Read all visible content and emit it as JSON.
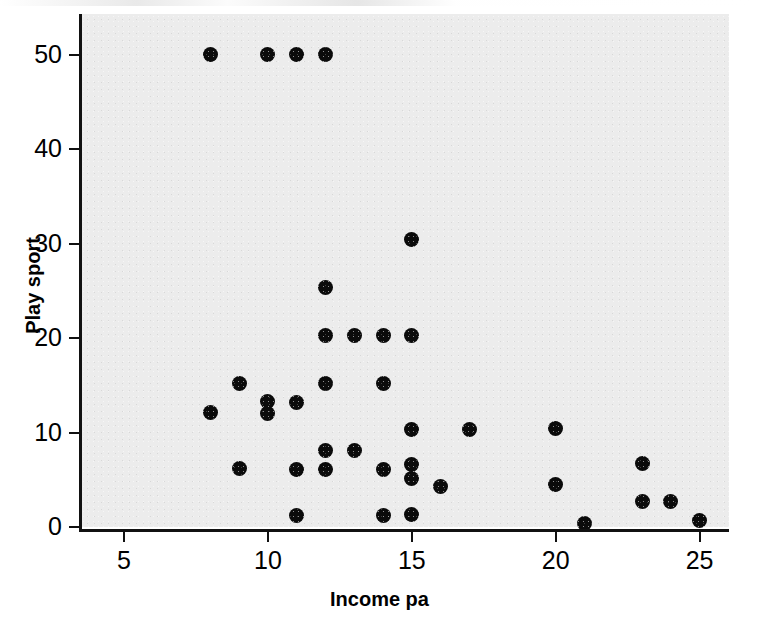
{
  "chart_data": {
    "type": "scatter",
    "title": "",
    "xlabel": "Income pa",
    "ylabel": "Play sport",
    "xlim": [
      3.8,
      26.3
    ],
    "ylim": [
      -1.5,
      54.5
    ],
    "xticks": [
      5,
      10,
      15,
      20,
      25
    ],
    "yticks": [
      0,
      10,
      20,
      30,
      40,
      50
    ],
    "xtick_labels": [
      "5",
      "10",
      "15",
      "20",
      "25"
    ],
    "ytick_labels": [
      "0",
      "10",
      "20",
      "30",
      "40",
      "50"
    ],
    "grid": false,
    "legend": false,
    "marker": "filled-circle",
    "marker_color": "#0b0b0b",
    "panel_color": "#ececec",
    "axis_color": "#111111",
    "points": [
      {
        "x": 8,
        "y": 50
      },
      {
        "x": 10,
        "y": 50
      },
      {
        "x": 11,
        "y": 50
      },
      {
        "x": 12,
        "y": 50
      },
      {
        "x": 15,
        "y": 30.4
      },
      {
        "x": 12,
        "y": 25.3
      },
      {
        "x": 12,
        "y": 20.3
      },
      {
        "x": 13,
        "y": 20.3
      },
      {
        "x": 14,
        "y": 20.3
      },
      {
        "x": 15,
        "y": 20.3
      },
      {
        "x": 9,
        "y": 15.2
      },
      {
        "x": 12,
        "y": 15.2
      },
      {
        "x": 14,
        "y": 15.2
      },
      {
        "x": 10,
        "y": 13.3
      },
      {
        "x": 11,
        "y": 13.2
      },
      {
        "x": 8,
        "y": 12.1
      },
      {
        "x": 10,
        "y": 12.0
      },
      {
        "x": 15,
        "y": 10.3
      },
      {
        "x": 17,
        "y": 10.3
      },
      {
        "x": 20,
        "y": 10.4
      },
      {
        "x": 12,
        "y": 8.1
      },
      {
        "x": 13,
        "y": 8.1
      },
      {
        "x": 23,
        "y": 6.7
      },
      {
        "x": 15,
        "y": 6.6
      },
      {
        "x": 9,
        "y": 6.2
      },
      {
        "x": 11,
        "y": 6.1
      },
      {
        "x": 12,
        "y": 6.1
      },
      {
        "x": 14,
        "y": 6.1
      },
      {
        "x": 15,
        "y": 5.1
      },
      {
        "x": 16,
        "y": 4.3
      },
      {
        "x": 20,
        "y": 4.5
      },
      {
        "x": 23,
        "y": 2.7
      },
      {
        "x": 24,
        "y": 2.7
      },
      {
        "x": 11,
        "y": 1.2
      },
      {
        "x": 14,
        "y": 1.2
      },
      {
        "x": 15,
        "y": 1.3
      },
      {
        "x": 25,
        "y": 0.7
      },
      {
        "x": 21,
        "y": 0.4
      }
    ]
  }
}
